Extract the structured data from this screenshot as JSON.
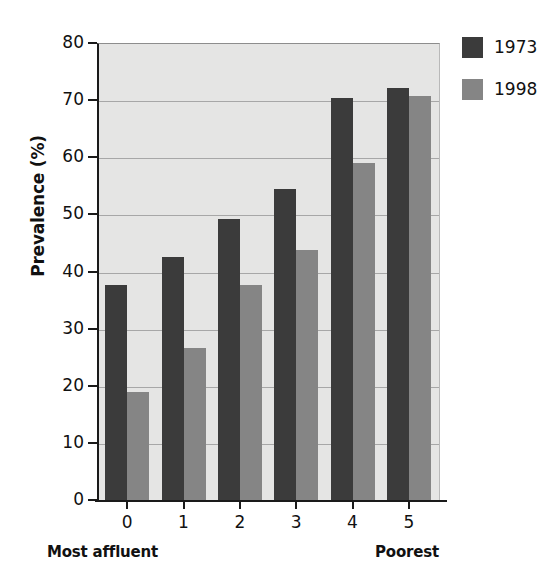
{
  "chart_data": {
    "type": "bar",
    "title": "",
    "subtitle": "",
    "xlabel": "",
    "ylabel": "Prevalence (%)",
    "categories": [
      "0",
      "1",
      "2",
      "3",
      "4",
      "5"
    ],
    "xlim_labels": {
      "left_annotation": "Most affluent",
      "right_annotation": "Poorest"
    },
    "ylim": [
      0,
      80
    ],
    "ytick_values": [
      0,
      10,
      20,
      30,
      40,
      50,
      60,
      70,
      80
    ],
    "ytick_labels": [
      "0",
      "10",
      "20",
      "30",
      "40",
      "50",
      "60",
      "70",
      "80"
    ],
    "grid": true,
    "grid_axis": "y",
    "legend_position": "upper right",
    "series": [
      {
        "name": "1973",
        "color": "#3b3b3b",
        "values": [
          37.6,
          42.5,
          49.2,
          54.5,
          70.4,
          72.2
        ]
      },
      {
        "name": "1998",
        "color": "#858585",
        "values": [
          18.9,
          26.6,
          37.6,
          43.8,
          59.0,
          70.8
        ]
      }
    ],
    "plot_background": "#e5e5e4",
    "figure_background": "#ffffff"
  }
}
